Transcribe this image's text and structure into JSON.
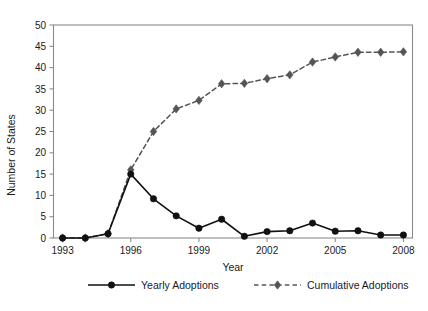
{
  "chart_data": {
    "type": "line",
    "title": "",
    "xlabel": "Year",
    "ylabel": "Number of States",
    "x": [
      1993,
      1994,
      1995,
      1996,
      1997,
      1998,
      1999,
      2000,
      2001,
      2002,
      2003,
      2004,
      2005,
      2006,
      2007,
      2008
    ],
    "xlim": [
      1992.6,
      2008.4
    ],
    "ylim": [
      0,
      50
    ],
    "xticks": [
      1993,
      1996,
      1999,
      2002,
      2005,
      2008
    ],
    "xtick_labels": [
      "1993",
      "1996",
      "1999",
      "2002",
      "2005",
      "2008"
    ],
    "yticks": [
      0,
      5,
      10,
      15,
      20,
      25,
      30,
      35,
      40,
      45,
      50
    ],
    "ytick_labels": [
      "0",
      "5",
      "10",
      "15",
      "20",
      "25",
      "30",
      "35",
      "40",
      "45",
      "50"
    ],
    "grid": false,
    "legend_position": "below",
    "series": [
      {
        "name": "Yearly Adoptions",
        "marker": "circle",
        "linestyle": "solid",
        "color": "#111111",
        "values": [
          0,
          0,
          1.0,
          15.0,
          9.2,
          5.2,
          2.3,
          4.4,
          0.4,
          1.5,
          1.7,
          3.5,
          1.6,
          1.7,
          0.7,
          0.7
        ]
      },
      {
        "name": "Cumulative Adoptions",
        "marker": "diamond",
        "linestyle": "dashed",
        "color": "#555555",
        "values": [
          0,
          0,
          1.0,
          16.0,
          25.0,
          30.3,
          32.3,
          36.2,
          36.3,
          37.4,
          38.3,
          41.3,
          42.5,
          43.6,
          43.6,
          43.7
        ]
      }
    ]
  },
  "legend": {
    "items": [
      {
        "label": "Yearly Adoptions",
        "marker": "circle",
        "linestyle": "solid",
        "color": "#111111"
      },
      {
        "label": "Cumulative Adoptions",
        "marker": "diamond",
        "linestyle": "dashed",
        "color": "#555555"
      }
    ]
  },
  "axes": {
    "y_title": "Number of States",
    "x_title": "Year"
  },
  "colors": {
    "yearly": "#111111",
    "cumulative": "#555555",
    "frame": "#8c8c8c",
    "text": "#1a1a1a",
    "background": "#ffffff"
  }
}
